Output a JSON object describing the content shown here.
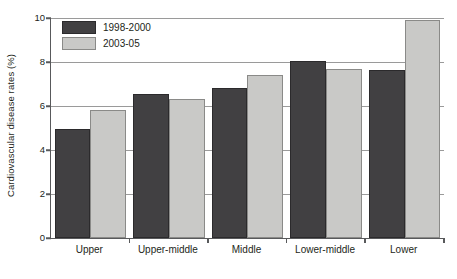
{
  "chart_data": {
    "type": "bar",
    "title": "",
    "xlabel": "",
    "ylabel": "Cardiovascular disease rates (%)",
    "ylim": [
      0,
      10
    ],
    "yticks": [
      0,
      2,
      4,
      6,
      8,
      10
    ],
    "ytick_labels": [
      "0",
      "2",
      "4",
      "6",
      "8",
      "10"
    ],
    "grid": true,
    "legend_position": "top-left",
    "categories": [
      "Upper",
      "Upper-middle",
      "Middle",
      "Lower-middle",
      "Lower"
    ],
    "series": [
      {
        "name": "1998-2000",
        "color": "#414042",
        "values": [
          4.95,
          6.55,
          6.8,
          8.05,
          7.65
        ]
      },
      {
        "name": "2003-05",
        "color": "#c9c9c7",
        "values": [
          5.8,
          6.3,
          7.4,
          7.7,
          9.9
        ]
      }
    ]
  },
  "axis": {
    "frame_color": "#58595b",
    "gridline_color": "#9a9a9a"
  }
}
